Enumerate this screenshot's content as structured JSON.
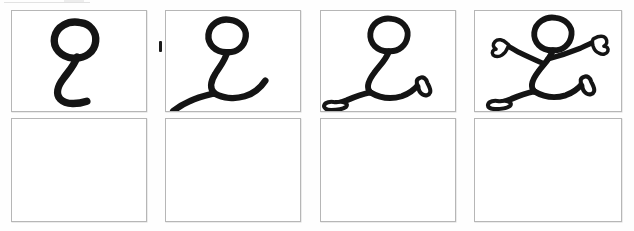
{
  "document": {
    "kind": "storyboard-sheet",
    "title": "Stick figure drawing sequence",
    "background_color": "#ffffff",
    "ink_color": "#141414",
    "frame_border_color": "#b6b6b6",
    "columns": 4,
    "rows": 2
  },
  "grid": {
    "panels": [
      {
        "id": "panel-1",
        "row": 1,
        "column": 1,
        "label": "Step 1",
        "content": "head-and-spine",
        "description": "A circular head loop with a single curving line descending and hooking to the right, forming head and spine.",
        "empty": false
      },
      {
        "id": "panel-2",
        "row": 1,
        "column": 2,
        "label": "Step 2",
        "content": "head-spine-and-legs",
        "description": "Head and spine with two leg lines added, one sweeping down-left and one curving right.",
        "empty": false
      },
      {
        "id": "panel-3",
        "row": 1,
        "column": 3,
        "label": "Step 3",
        "content": "figure-with-shoes",
        "description": "Running figure outline with shoes drawn at the end of each leg.",
        "empty": false
      },
      {
        "id": "panel-4",
        "row": 1,
        "column": 4,
        "label": "Step 4",
        "content": "complete-running-figure",
        "description": "Complete running stick figure with head, body, two legs with shoes, and two outstretched arms with mitten hands.",
        "empty": false
      },
      {
        "id": "panel-5",
        "row": 2,
        "column": 1,
        "label": "Step 5",
        "content": "blank",
        "description": "Empty frame.",
        "empty": true
      },
      {
        "id": "panel-6",
        "row": 2,
        "column": 2,
        "label": "Step 6",
        "content": "blank",
        "description": "Empty frame.",
        "empty": true
      },
      {
        "id": "panel-7",
        "row": 2,
        "column": 3,
        "label": "Step 7",
        "content": "blank",
        "description": "Empty frame.",
        "empty": true
      },
      {
        "id": "panel-8",
        "row": 2,
        "column": 4,
        "label": "Step 8",
        "content": "blank",
        "description": "Empty frame.",
        "empty": true
      }
    ]
  },
  "marks": {
    "ink_smudge": {
      "name": "stray-ink-mark",
      "description": "Small dark vertical ink mark on the divider between the first and second top-row frames."
    },
    "scan_line": {
      "name": "scan-artifact-line",
      "description": "Faint light-grey horizontal line fragment along the very top-left edge of the scan."
    }
  }
}
